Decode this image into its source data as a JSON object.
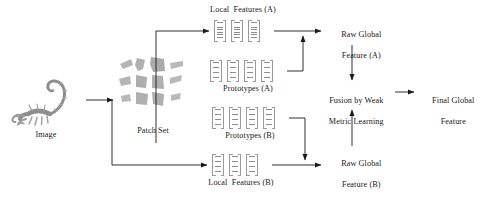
{
  "figure": {
    "type": "flow-diagram",
    "background": "#ffffff",
    "line_color": "#1a1a1a",
    "glyph_color": "#8d8d8d"
  },
  "nodes": {
    "image": {
      "label": "Image"
    },
    "patch_set": {
      "label": "Patch Set"
    },
    "local_features_a": {
      "label": "Local  Features (A)",
      "count": 3
    },
    "prototypes_a": {
      "label": "Prototypes (A)",
      "count": 4
    },
    "prototypes_b": {
      "label": "Prototypes (B)",
      "count": 4
    },
    "local_features_b": {
      "label": "Local  Features (B)",
      "count": 3
    },
    "raw_global_a": {
      "line1": "Raw Global",
      "line2": "Feature (A)"
    },
    "raw_global_b": {
      "line1": "Raw Global",
      "line2": "Feature (B)"
    },
    "fusion": {
      "line1": "Fusion by Weak",
      "line2": "Metric Learning"
    },
    "final_global": {
      "line1": "Final Global",
      "line2": "Feature"
    }
  },
  "edges": [
    {
      "from": "image",
      "to": "patch-set",
      "kind": "arrow-right"
    },
    {
      "from": "patch-set",
      "to": "local-features-a",
      "kind": "elbow-up-right"
    },
    {
      "from": "patch-set",
      "to": "local-features-b",
      "kind": "elbow-down-right"
    },
    {
      "from": "local-features-a",
      "to": "raw-global-a",
      "kind": "arrow-right"
    },
    {
      "from": "prototypes-a",
      "to": "raw-global-a",
      "kind": "elbow-right-down-up"
    },
    {
      "from": "local-features-b",
      "to": "raw-global-b",
      "kind": "arrow-right"
    },
    {
      "from": "prototypes-b",
      "to": "raw-global-b",
      "kind": "elbow-right-down"
    },
    {
      "from": "raw-global-a",
      "to": "fusion",
      "kind": "arrow-down"
    },
    {
      "from": "raw-global-b",
      "to": "fusion",
      "kind": "arrow-up"
    },
    {
      "from": "fusion",
      "to": "final-global",
      "kind": "arrow-right"
    }
  ]
}
